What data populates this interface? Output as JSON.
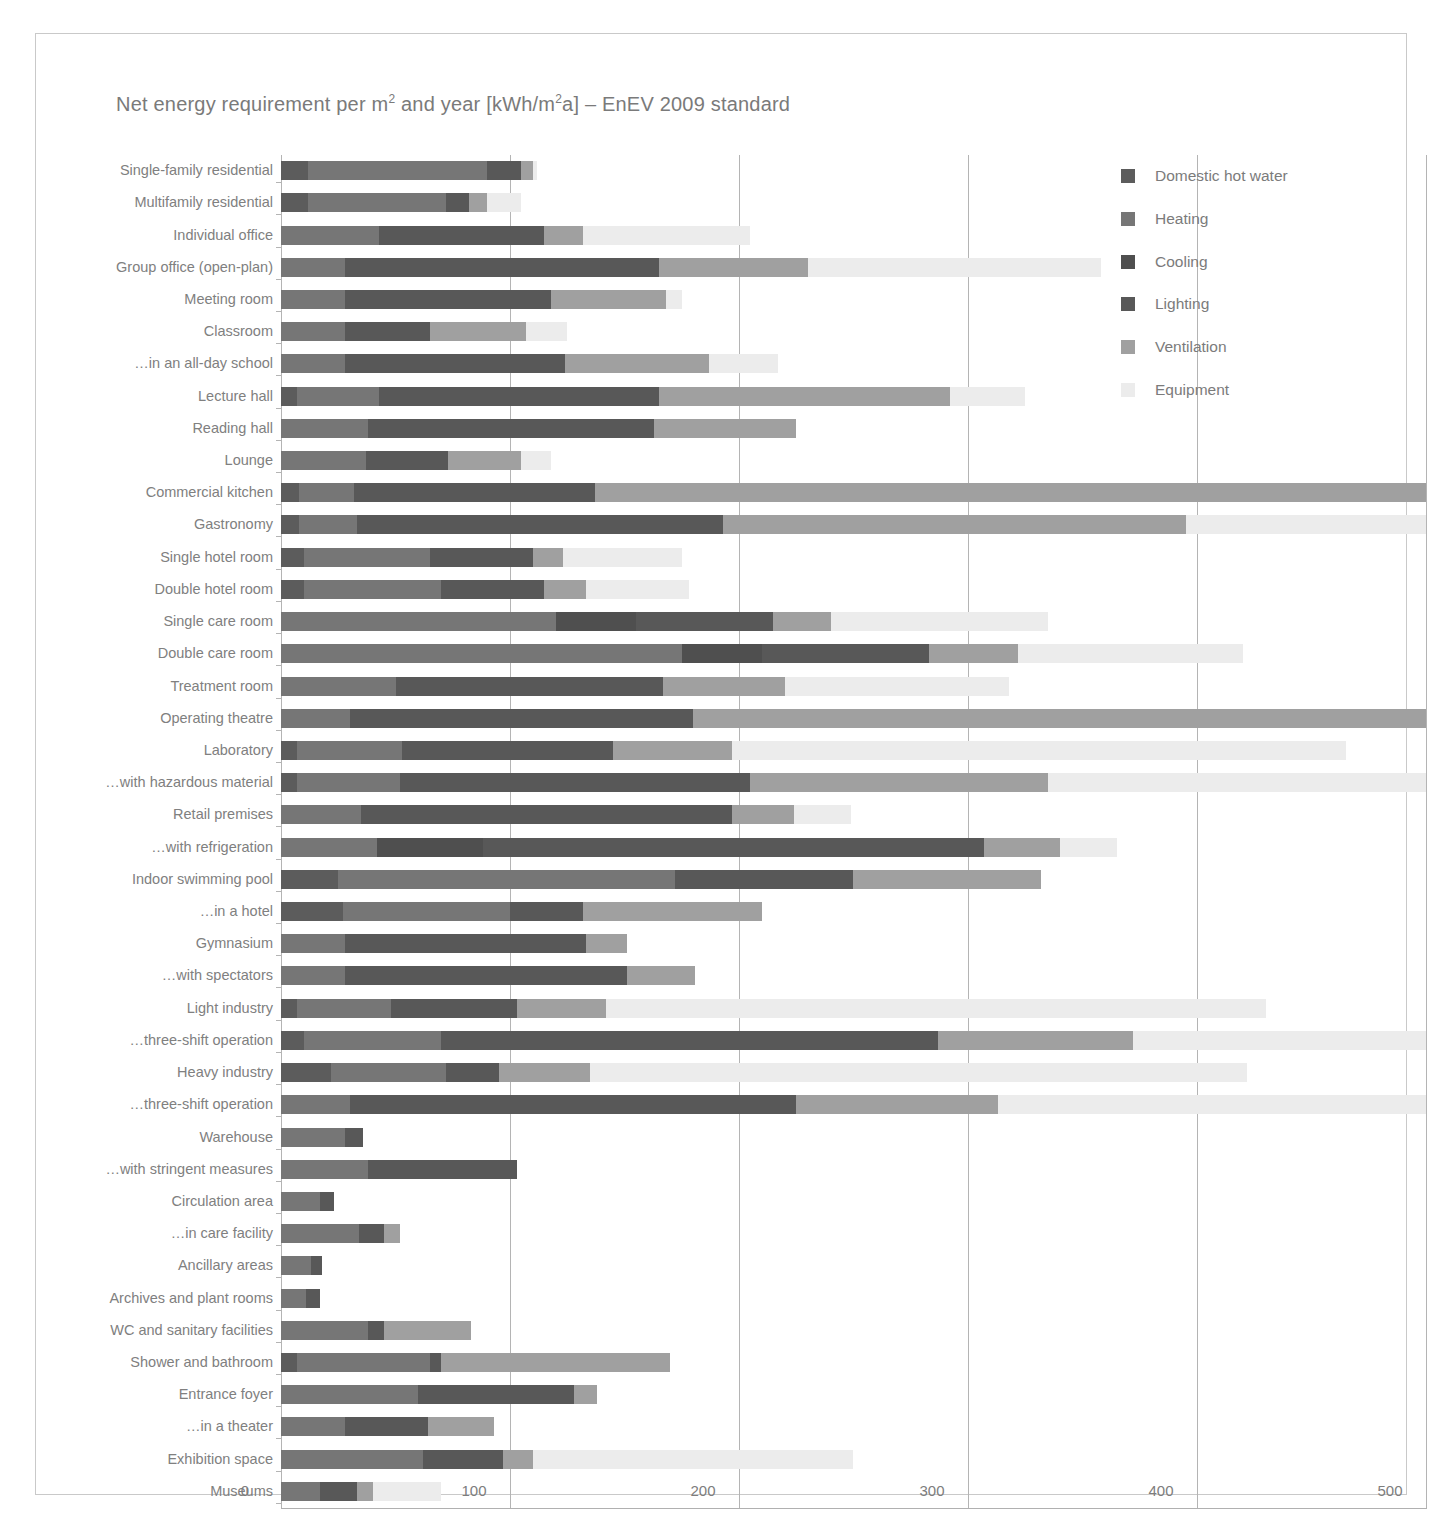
{
  "title_prefix": "Net energy requirement per m",
  "legend": {
    "position": "top-right",
    "items": [
      {
        "label": "Domestic hot water",
        "color": "#5c5c5c"
      },
      {
        "label": "Heating",
        "color": "#767676"
      },
      {
        "label": "Cooling",
        "color": "#4f4f4f"
      },
      {
        "label": "Lighting",
        "color": "#585858"
      },
      {
        "label": "Ventilation",
        "color": "#a0a0a0"
      },
      {
        "label": "Equipment",
        "color": "#ececec"
      }
    ]
  },
  "axis": {
    "ticks": [
      "0",
      "100",
      "200",
      "300",
      "400",
      "500"
    ],
    "min": 0,
    "max": 500,
    "unit": "kWh/m²a"
  },
  "chart_data": {
    "type": "bar",
    "orientation": "horizontal",
    "stacked": true,
    "xlabel": "",
    "ylabel": "",
    "xlim": [
      0,
      500
    ],
    "grid": true,
    "legend_position": "top-right",
    "series_names": [
      "Domestic hot water",
      "Heating",
      "Cooling",
      "Lighting",
      "Ventilation",
      "Equipment"
    ],
    "series_colors": [
      "#5c5c5c",
      "#767676",
      "#4f4f4f",
      "#585858",
      "#a0a0a0",
      "#ececec"
    ],
    "categories": [
      "Single-family residential",
      "Multifamily residential",
      "Individual office",
      "Group office (open-plan)",
      "Meeting room",
      "Classroom",
      "…in an all-day school",
      "Lecture hall",
      "Reading hall",
      "Lounge",
      "Commercial kitchen",
      "Gastronomy",
      "Single hotel room",
      "Double hotel room",
      "Single care room",
      "Double care room",
      "Treatment room",
      "Operating theatre",
      "Laboratory",
      "…with hazardous material",
      "Retail premises",
      "…with refrigeration",
      "Indoor swimming pool",
      "…in a hotel",
      "Gymnasium",
      "…with spectators",
      "Light industry",
      "…three-shift operation",
      "Heavy industry",
      "…three-shift operation",
      "Warehouse",
      "…with stringent measures",
      "Circulation area",
      "…in care facility",
      "Ancillary areas",
      "Archives and plant rooms",
      "WC and sanitary facilities",
      "Shower and bathroom",
      "Entrance foyer",
      "…in a theater",
      "Exhibition space",
      "Museums"
    ],
    "series": [
      {
        "name": "Domestic hot water",
        "values": [
          12,
          12,
          0,
          0,
          0,
          0,
          0,
          7,
          0,
          0,
          8,
          8,
          10,
          10,
          0,
          0,
          0,
          0,
          7,
          7,
          0,
          0,
          25,
          27,
          0,
          0,
          7,
          10,
          22,
          0,
          0,
          0,
          0,
          0,
          0,
          0,
          0,
          7,
          0,
          0,
          0,
          0
        ]
      },
      {
        "name": "Heating",
        "values": [
          78,
          60,
          43,
          28,
          28,
          28,
          28,
          36,
          38,
          37,
          24,
          25,
          55,
          60,
          120,
          175,
          50,
          30,
          46,
          45,
          35,
          42,
          147,
          73,
          28,
          28,
          41,
          60,
          50,
          30,
          28,
          38,
          17,
          34,
          13,
          11,
          38,
          58,
          60,
          28,
          62,
          17
        ]
      },
      {
        "name": "Cooling",
        "values": [
          0,
          0,
          0,
          0,
          0,
          0,
          0,
          0,
          0,
          0,
          0,
          0,
          0,
          0,
          35,
          35,
          0,
          0,
          0,
          0,
          0,
          46,
          0,
          0,
          0,
          0,
          0,
          0,
          0,
          0,
          0,
          0,
          0,
          0,
          0,
          0,
          0,
          0,
          0,
          0,
          0,
          0
        ]
      },
      {
        "name": "Lighting",
        "values": [
          15,
          10,
          72,
          137,
          90,
          37,
          96,
          122,
          125,
          36,
          105,
          160,
          45,
          45,
          60,
          73,
          117,
          150,
          92,
          153,
          162,
          219,
          78,
          32,
          105,
          123,
          55,
          217,
          23,
          195,
          8,
          65,
          6,
          11,
          5,
          6,
          7,
          5,
          68,
          36,
          35,
          16
        ]
      },
      {
        "name": "Ventilation",
        "values": [
          5,
          8,
          17,
          65,
          50,
          42,
          63,
          127,
          62,
          32,
          363,
          202,
          13,
          18,
          25,
          39,
          53,
          320,
          52,
          130,
          27,
          33,
          82,
          78,
          18,
          30,
          39,
          85,
          40,
          88,
          0,
          0,
          0,
          7,
          0,
          0,
          38,
          100,
          10,
          29,
          13,
          7
        ]
      },
      {
        "name": "Equipment",
        "values": [
          2,
          15,
          73,
          128,
          7,
          18,
          30,
          33,
          0,
          13,
          0,
          105,
          52,
          45,
          95,
          98,
          98,
          0,
          268,
          165,
          25,
          25,
          0,
          0,
          0,
          0,
          288,
          128,
          287,
          187,
          0,
          0,
          0,
          0,
          0,
          0,
          0,
          0,
          0,
          0,
          140,
          30
        ]
      }
    ],
    "totals": [
      112,
      105,
      205,
      358,
      168,
      125,
      217,
      325,
      225,
      118,
      500,
      500,
      175,
      178,
      335,
      420,
      318,
      500,
      465,
      500,
      249,
      365,
      332,
      210,
      151,
      181,
      430,
      500,
      422,
      500,
      36,
      103,
      23,
      52,
      18,
      17,
      83,
      170,
      138,
      93,
      250,
      70
    ]
  }
}
